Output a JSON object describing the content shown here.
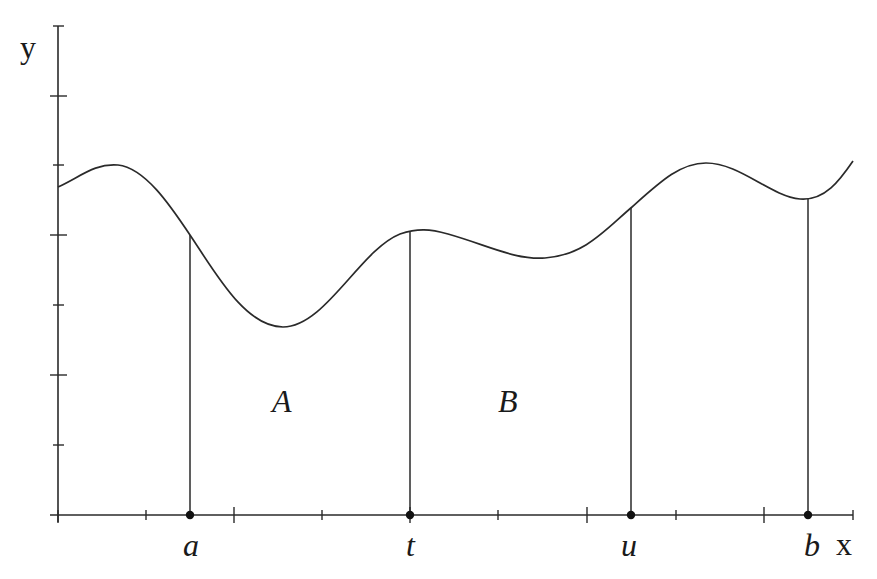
{
  "figure": {
    "type": "area-under-curve diagram",
    "axes": {
      "x_label": "x",
      "y_label": "y",
      "origin_px": [
        58,
        515
      ],
      "x_end_px": 853,
      "y_top_px": 26,
      "x_ticks_px": [
        {
          "x": 146,
          "size": "short"
        },
        {
          "x": 234,
          "size": "long"
        },
        {
          "x": 322,
          "size": "short"
        },
        {
          "x": 410,
          "size": "long"
        },
        {
          "x": 498,
          "size": "short"
        },
        {
          "x": 587,
          "size": "long"
        },
        {
          "x": 676,
          "size": "short"
        },
        {
          "x": 764,
          "size": "long"
        },
        {
          "x": 853,
          "size": "short"
        }
      ],
      "y_ticks_px": [
        {
          "y": 26,
          "size": "short"
        },
        {
          "y": 96,
          "size": "long"
        },
        {
          "y": 165,
          "size": "short"
        },
        {
          "y": 235,
          "size": "long"
        },
        {
          "y": 305,
          "size": "short"
        },
        {
          "y": 375,
          "size": "long"
        },
        {
          "y": 445,
          "size": "short"
        }
      ]
    },
    "curve": {
      "description": "smooth wavy function y = f(x)",
      "key_points_px": [
        [
          58,
          187
        ],
        [
          115,
          165
        ],
        [
          190,
          235
        ],
        [
          283,
          327
        ],
        [
          410,
          232
        ],
        [
          425,
          230
        ],
        [
          540,
          258
        ],
        [
          632,
          208
        ],
        [
          706,
          163
        ],
        [
          800,
          199
        ],
        [
          853,
          161
        ]
      ]
    },
    "marked_points": [
      {
        "label": "a",
        "x_px": 190,
        "curve_y_px": 235
      },
      {
        "label": "t",
        "x_px": 410,
        "curve_y_px": 232
      },
      {
        "label": "u",
        "x_px": 631,
        "curve_y_px": 208
      },
      {
        "label": "b",
        "x_px": 808,
        "curve_y_px": 198
      }
    ],
    "regions": [
      {
        "label": "A",
        "from": "a",
        "to": "t",
        "label_pos_px": [
          285,
          412
        ]
      },
      {
        "label": "B",
        "from": "t",
        "to": "u",
        "label_pos_px": [
          511,
          412
        ]
      }
    ]
  },
  "labels": {
    "y_axis": "y",
    "x_axis": "x",
    "point_a": "a",
    "point_t": "t",
    "point_u": "u",
    "point_b": "b",
    "region_a": "A",
    "region_b": "B"
  },
  "colors": {
    "ink": "#2a2a2a",
    "background": "#ffffff"
  }
}
